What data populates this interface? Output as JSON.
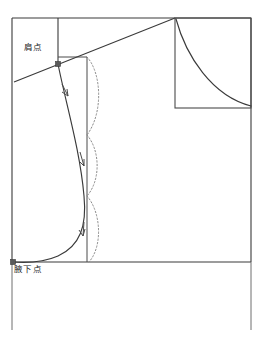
{
  "diagram": {
    "type": "garment-pattern-construction",
    "background_color": "#ffffff",
    "line_color": "#3a3a3a",
    "dotted_color": "#7a7a7a",
    "marker_color": "#555555",
    "labels": {
      "shoulder_point": "肩点",
      "underarm_point": "腋下点"
    },
    "frame": {
      "left": 12,
      "right": 251,
      "top": 18,
      "baseline": 262,
      "bottom_open": 330
    },
    "guides": {
      "vertical_top_x": 58,
      "vertical_inner_x": 87,
      "vertical_lower_left_x": 12,
      "vertical_lower_right_x": 251
    },
    "shoulder_slope_line": {
      "from_x": 14,
      "from_y": 82,
      "to_x": 175,
      "to_y": 18
    },
    "shoulder_point_marker": {
      "x": 58,
      "y": 64
    },
    "underarm_point_marker": {
      "x": 13,
      "y": 262
    },
    "armhole_curve": {
      "description": "solid armhole seam curve from shoulder point to underarm point",
      "start": {
        "x": 58,
        "y": 64
      },
      "end": {
        "x": 13,
        "y": 262
      }
    },
    "direction_arrows": [
      {
        "x": 65,
        "y": 90
      },
      {
        "x": 79,
        "y": 160
      },
      {
        "x": 83,
        "y": 232
      }
    ],
    "dotted_arcs": [
      {
        "from_y": 57,
        "to_y": 135,
        "bulge_x": 103
      },
      {
        "from_y": 135,
        "to_y": 196,
        "bulge_x": 101
      },
      {
        "from_y": 196,
        "to_y": 262,
        "bulge_x": 102
      }
    ],
    "inset": {
      "name": "armhole-curvature-detail",
      "left": 175,
      "top": 18,
      "right": 251,
      "bottom": 108,
      "curve": "concave sweep from top-left corner to bottom-right corner"
    }
  }
}
